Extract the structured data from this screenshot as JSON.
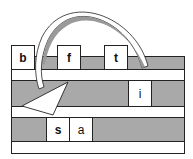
{
  "diagram": {
    "rows": [
      {
        "id": "row-1",
        "tiles": [
          {
            "letter": "b"
          },
          {
            "letter": "f"
          },
          {
            "letter": "t"
          }
        ]
      },
      {
        "id": "row-2",
        "tiles": [
          {
            "letter": "i"
          }
        ]
      },
      {
        "id": "row-3",
        "tiles": [
          {
            "letter": "s"
          },
          {
            "letter": "a"
          }
        ]
      }
    ],
    "arrow": {
      "from": "row-1 right end",
      "to": "row-3 left",
      "style": "curved, white fill with gray shading"
    },
    "colors": {
      "track": "#a9a9a9",
      "gap": "#ffffff",
      "outline": "#222222",
      "arrow_shade": "#9a9a9a"
    }
  }
}
